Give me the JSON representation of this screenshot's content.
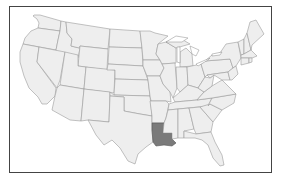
{
  "map": {
    "title": "",
    "region": "Contiguous United States",
    "highlighted_state": "Louisiana",
    "colors": {
      "frame_border": "#444444",
      "state_fill": "#eeeeee",
      "state_border": "#9a9a9a",
      "highlight_fill": "#7a7a7a",
      "background": "#ffffff"
    }
  }
}
